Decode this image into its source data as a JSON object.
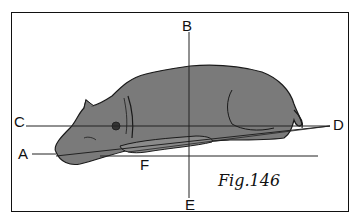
{
  "figure": {
    "caption": "Fig. 146",
    "caption_display": "Fig.146",
    "labels": {
      "A": "A",
      "B": "B",
      "C": "C",
      "D": "D",
      "E": "E",
      "F": "F"
    },
    "colors": {
      "frame": "#111111",
      "lines": "#222222",
      "dog_fill": "#7a7a7a",
      "dog_outline": "#1a1a1a",
      "background": "#ffffff"
    }
  }
}
